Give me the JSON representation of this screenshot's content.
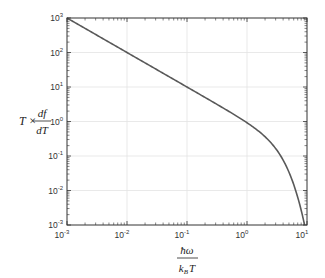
{
  "chart_data": {
    "type": "line",
    "title": "",
    "xlabel": "ħω / k_B T",
    "ylabel": "T × df/dT",
    "xscale": "log",
    "yscale": "log",
    "xlim": [
      0.001,
      10
    ],
    "ylim": [
      0.001,
      1000
    ],
    "grid": true,
    "legend": null,
    "x_ticks": [
      "10^-3",
      "10^-2",
      "10^-1",
      "10^0",
      "10^1"
    ],
    "y_ticks": [
      "10^-3",
      "10^-2",
      "10^-1",
      "10^0",
      "10^1",
      "10^2",
      "10^3"
    ],
    "series": [
      {
        "name": "T·df/dT",
        "color": "#595959",
        "x": [
          0.001,
          0.003,
          0.01,
          0.03,
          0.1,
          0.3,
          0.5,
          1,
          1.5,
          2,
          3,
          4,
          5,
          6,
          7,
          8,
          9,
          9.6
        ],
        "y": [
          1000,
          333.3,
          100,
          33.33,
          9.99,
          3.31,
          1.96,
          0.921,
          0.585,
          0.362,
          0.165,
          0.0757,
          0.0341,
          0.0149,
          0.0064,
          0.00268,
          0.00111,
          0.00065
        ]
      }
    ]
  },
  "axes": {
    "x_label_top": "ħω",
    "x_label_bottom_k": "k",
    "x_label_bottom_sub": "B",
    "x_label_bottom_T": "T",
    "y_label_prefix": "T ×",
    "y_label_num": "df",
    "y_label_den": "dT",
    "x_tick_labels": [
      {
        "base": "10",
        "exp": "-3"
      },
      {
        "base": "10",
        "exp": "-2"
      },
      {
        "base": "10",
        "exp": "-1"
      },
      {
        "base": "10",
        "exp": "0"
      },
      {
        "base": "10",
        "exp": "1"
      }
    ],
    "y_tick_labels": [
      {
        "base": "10",
        "exp": "3"
      },
      {
        "base": "10",
        "exp": "2"
      },
      {
        "base": "10",
        "exp": "1"
      },
      {
        "base": "10",
        "exp": "0"
      },
      {
        "base": "10",
        "exp": "-1"
      },
      {
        "base": "10",
        "exp": "-2"
      },
      {
        "base": "10",
        "exp": "-3"
      }
    ]
  },
  "colors": {
    "curve": "#595959",
    "grid": "#e3e3e3",
    "frame": "#333333"
  }
}
